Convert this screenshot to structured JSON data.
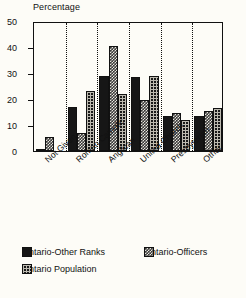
{
  "chart_data": {
    "type": "bar",
    "title": "Percentage",
    "xlabel": "",
    "ylabel": "Percentage",
    "ylim": [
      0,
      50
    ],
    "yticks": [
      0,
      10,
      20,
      30,
      40,
      50
    ],
    "grid": false,
    "group_separators": true,
    "legend_position": "bottom-left",
    "categories": [
      "Not Given",
      "Roman Catholic",
      "Anglican",
      "United Church",
      "Presbyterian",
      "Other"
    ],
    "series": [
      {
        "name": "Ontario-Other Ranks",
        "pattern": "solid-black",
        "color": "#161616",
        "values": [
          0.3,
          17.0,
          29.0,
          28.5,
          13.5,
          13.5
        ]
      },
      {
        "name": "Ontario-Officers",
        "pattern": "light-checker",
        "color": "#3a3a3a",
        "values": [
          5.2,
          7.0,
          40.2,
          19.5,
          14.5,
          15.5
        ]
      },
      {
        "name": "Ontario Population",
        "pattern": "dark-crosshatch",
        "color": "#181818",
        "values": [
          0,
          23.0,
          21.8,
          29.0,
          12.0,
          16.5
        ]
      }
    ]
  },
  "axis": {
    "y_tick_labels": [
      "50",
      "40",
      "30",
      "20",
      "10",
      "0"
    ]
  },
  "legend": {
    "items": [
      {
        "label": "Ontario-Other Ranks"
      },
      {
        "label": "Ontario-Officers"
      },
      {
        "label": "Ontario Population"
      }
    ]
  }
}
